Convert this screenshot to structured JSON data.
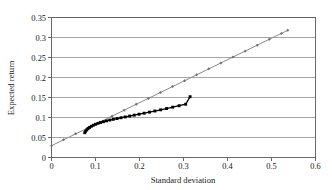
{
  "chart_data": {
    "type": "line",
    "title": "",
    "xlabel": "Standard deviation",
    "ylabel": "Expected return",
    "xlim": [
      0,
      0.6
    ],
    "ylim": [
      0,
      0.35
    ],
    "grid": "horizontal",
    "legend": "none",
    "xticks": [
      "0",
      "0.1",
      "0.2",
      "0.3",
      "0.4",
      "0.5",
      "0.6"
    ],
    "xtick_values": [
      0,
      0.1,
      0.2,
      0.3,
      0.4,
      0.5,
      0.6
    ],
    "yticks": [
      "0",
      "0.05",
      "0.1",
      "0.15",
      "0.2",
      "0.25",
      "0.3",
      "0.35"
    ],
    "ytick_values": [
      0,
      0.05,
      0.1,
      0.15,
      0.2,
      0.25,
      0.3,
      0.35
    ],
    "series": [
      {
        "name": "capital-market-line",
        "marker": "diamond",
        "color": "#8a8a8a",
        "x": [
          0.0,
          0.0275,
          0.055,
          0.0825,
          0.11,
          0.1375,
          0.165,
          0.1925,
          0.22,
          0.2475,
          0.275,
          0.3025,
          0.33,
          0.3575,
          0.385,
          0.4125,
          0.44,
          0.4675,
          0.495,
          0.5225,
          0.537
        ],
        "y": [
          0.0295,
          0.0443,
          0.0591,
          0.0738,
          0.0886,
          0.1034,
          0.1182,
          0.1329,
          0.1477,
          0.1625,
          0.1773,
          0.192,
          0.2068,
          0.2216,
          0.2364,
          0.2511,
          0.2659,
          0.2807,
          0.2955,
          0.3102,
          0.318
        ]
      },
      {
        "name": "efficient-frontier",
        "marker": "square",
        "color": "#000000",
        "x": [
          0.0755,
          0.0775,
          0.08,
          0.083,
          0.0865,
          0.0905,
          0.095,
          0.1,
          0.1055,
          0.1115,
          0.118,
          0.125,
          0.1325,
          0.1405,
          0.149,
          0.158,
          0.1675,
          0.1775,
          0.188,
          0.199,
          0.2105,
          0.2225,
          0.235,
          0.248,
          0.2615,
          0.2755,
          0.29,
          0.305,
          0.315
        ],
        "y": [
          0.062,
          0.0655,
          0.069,
          0.0722,
          0.0752,
          0.078,
          0.0806,
          0.083,
          0.0853,
          0.0875,
          0.0896,
          0.0916,
          0.0936,
          0.0955,
          0.0974,
          0.0994,
          0.1014,
          0.1036,
          0.1058,
          0.1082,
          0.1107,
          0.1134,
          0.1162,
          0.1192,
          0.1224,
          0.1258,
          0.1294,
          0.1332,
          0.152
        ]
      }
    ],
    "annotations": []
  }
}
